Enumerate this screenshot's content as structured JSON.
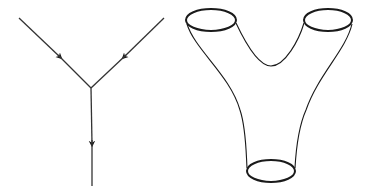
{
  "figure": {
    "panels": [
      {
        "id": "vertex-graph",
        "description": "Trivalent vertex: two incoming directed edges merging into one outgoing edge",
        "edges": [
          {
            "name": "incoming-left",
            "from": [
              19,
              18
            ],
            "to": [
              91,
              88
            ],
            "arrow": true
          },
          {
            "name": "incoming-right",
            "from": [
              164,
              18
            ],
            "to": [
              91,
              88
            ],
            "arrow": true
          },
          {
            "name": "outgoing-down",
            "from": [
              91,
              88
            ],
            "to": [
              92,
              186
            ],
            "arrow": true
          }
        ]
      },
      {
        "id": "pants-surface",
        "description": "Pair-of-pants cobordism: two circles at top joined into one circle at bottom",
        "boundary_circles": [
          {
            "name": "top-left-circle",
            "cx": 211,
            "cy": 20,
            "rx": 25,
            "ry": 11
          },
          {
            "name": "top-right-circle",
            "cx": 328,
            "cy": 20,
            "rx": 24,
            "ry": 11
          },
          {
            "name": "bottom-circle",
            "cx": 271,
            "cy": 171,
            "rx": 24,
            "ry": 11
          }
        ]
      }
    ],
    "colors": {
      "stroke": "#222222",
      "background": "#ffffff"
    }
  }
}
